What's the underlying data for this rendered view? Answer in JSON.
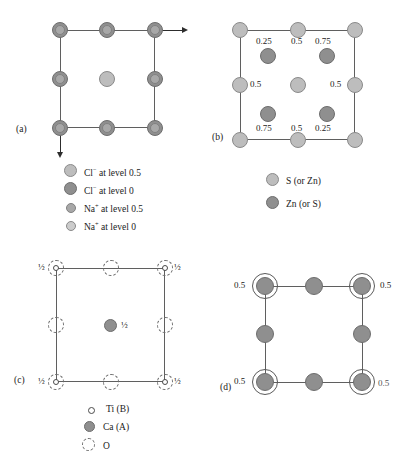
{
  "figure": {
    "type": "crystal-structure-projection-diagram",
    "panel_count": 4
  },
  "panels": {
    "a": {
      "id": "(a)",
      "structure": "rock salt (NaCl)",
      "legend": [
        {
          "marker": "large-light-circle",
          "label": "Cl− at level 0.5",
          "species": "Cl",
          "charge": "−",
          "level": "0.5",
          "color": "#bdbdbd",
          "size": "large"
        },
        {
          "marker": "large-dark-circle",
          "label": "Cl− at level 0",
          "species": "Cl",
          "charge": "−",
          "level": "0",
          "color": "#8f8f8f",
          "size": "large"
        },
        {
          "marker": "small-mid-circle",
          "label": "Na+ at level 0.5",
          "species": "Na",
          "charge": "+",
          "level": "0.5",
          "color": "#a8a8a8",
          "size": "small"
        },
        {
          "marker": "small-light-circle",
          "label": "Na+ at level 0",
          "species": "Na",
          "charge": "+",
          "level": "0",
          "color": "#cccccc",
          "size": "small"
        }
      ],
      "axis_arrows": [
        "right",
        "down"
      ]
    },
    "b": {
      "id": "(b)",
      "structure": "zinc blende (ZnS)",
      "fraction_labels": [
        "0.25",
        "0.5",
        "0.75",
        "0.5",
        "0.5",
        "0.75",
        "0.5",
        "0.25"
      ],
      "labels": {
        "top_left": "0.25",
        "top_mid": "0.5",
        "top_right": "0.75",
        "mid_left": "0.5",
        "mid_right": "0.5",
        "bot_left": "0.75",
        "bot_mid": "0.5",
        "bot_right": "0.25"
      },
      "legend": [
        {
          "marker": "light-circle",
          "label": "S (or Zn)",
          "color": "#bdbdbd"
        },
        {
          "marker": "dark-circle",
          "label": "Zn (or S)",
          "color": "#8f8f8f"
        }
      ]
    },
    "c": {
      "id": "(c)",
      "structure": "perovskite (CaTiO3)",
      "labels": {
        "top_left": "½",
        "top_right": "½",
        "center": "½",
        "bot_left": "½",
        "bot_right": "½"
      },
      "legend": [
        {
          "marker": "open-circle",
          "label": "Ti (B)"
        },
        {
          "marker": "filled-gray-circle",
          "label": "Ca (A)",
          "color": "#8f8f8f"
        },
        {
          "marker": "dashed-circle",
          "label": "O"
        }
      ]
    },
    "d": {
      "id": "(d)",
      "structure": "layered projection",
      "labels": {
        "top_left": "0.5",
        "top_right": "0.5",
        "bot_left": "0.5",
        "bot_right": "0.5"
      }
    }
  }
}
